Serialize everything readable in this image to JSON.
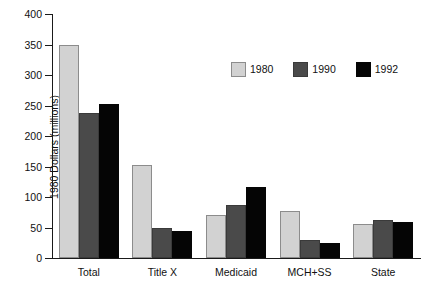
{
  "chart_data": {
    "type": "bar",
    "title": "",
    "xlabel": "",
    "ylabel": "1980 Dollars (millions)",
    "categories": [
      "Total",
      "Title X",
      "Medicaid",
      "MCH+SS",
      "State"
    ],
    "series": [
      {
        "name": "1980",
        "color": "#d2d2d2",
        "values": [
          350,
          152,
          70,
          77,
          56
        ]
      },
      {
        "name": "1990",
        "color": "#4a4a4a",
        "values": [
          237,
          50,
          87,
          30,
          63
        ]
      },
      {
        "name": "1992",
        "color": "#050505",
        "values": [
          253,
          45,
          117,
          25,
          59
        ]
      }
    ],
    "ylim": [
      0,
      400
    ],
    "yticks": [
      0,
      50,
      100,
      150,
      200,
      250,
      300,
      350,
      400
    ],
    "ytick_labels": [
      "0",
      "50",
      "100",
      "150",
      "200",
      "250",
      "300",
      "350",
      "400"
    ],
    "grid": false,
    "legend_position": "top-right"
  }
}
